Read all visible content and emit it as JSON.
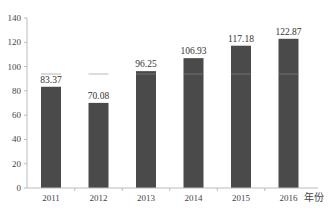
{
  "chart_data": {
    "type": "bar",
    "title": "",
    "xlabel": "年份",
    "ylabel": "",
    "categories": [
      "2011",
      "2012",
      "2013",
      "2014",
      "2015",
      "2016"
    ],
    "values": [
      83.37,
      70.08,
      96.25,
      106.93,
      117.18,
      122.87
    ],
    "value_labels": [
      "83.37",
      "70.08",
      "96.25",
      "106.93",
      "117.18",
      "122.87"
    ],
    "ylim": [
      0,
      140
    ],
    "yticks": [
      0,
      20,
      40,
      60,
      80,
      100,
      120,
      140
    ],
    "grid": false,
    "legend": null,
    "bar_color": "#4a4a4a"
  }
}
